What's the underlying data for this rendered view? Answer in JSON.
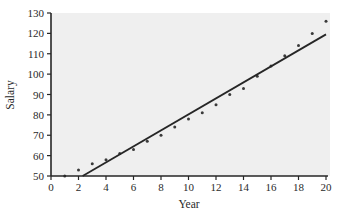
{
  "chart_data": {
    "type": "scatter",
    "title": "",
    "xlabel": "Year",
    "ylabel": "Salary",
    "xlim": [
      0,
      20
    ],
    "ylim": [
      50,
      130
    ],
    "xticks": [
      0,
      2,
      4,
      6,
      8,
      10,
      12,
      14,
      16,
      18,
      20
    ],
    "yticks": [
      50,
      60,
      70,
      80,
      90,
      100,
      110,
      120,
      130
    ],
    "grid": false,
    "legend": null,
    "series": [
      {
        "name": "Salary data",
        "type": "scatter",
        "x": [
          1,
          2,
          3,
          4,
          5,
          6,
          7,
          8,
          9,
          10,
          11,
          12,
          13,
          14,
          15,
          16,
          17,
          18,
          19,
          20
        ],
        "y": [
          50,
          53,
          56,
          58,
          61,
          63,
          67,
          70,
          74,
          78,
          81,
          85,
          90,
          93,
          99,
          104,
          109,
          114,
          120,
          126
        ]
      },
      {
        "name": "Linear fit",
        "type": "line",
        "x": [
          2.3,
          20
        ],
        "y": [
          50,
          119.5
        ]
      }
    ],
    "colors": {
      "plot_background": "#efefef",
      "points": "#3a3a3a",
      "line": "#262626",
      "axis": "#262626"
    }
  }
}
